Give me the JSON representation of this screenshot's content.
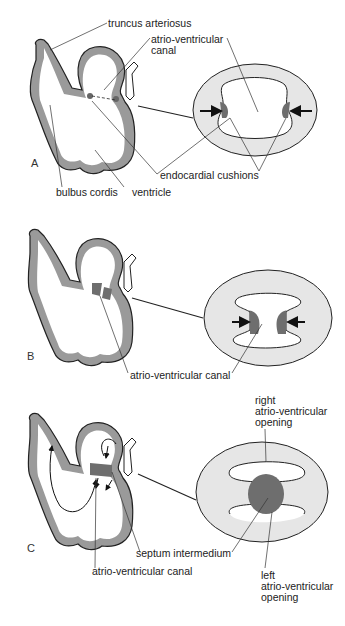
{
  "panels": [
    {
      "id": "A",
      "letter": "A",
      "labels": {
        "truncus": "truncus arteriosus",
        "av_canal_1": "atrio-ventricular",
        "av_canal_2": "canal",
        "endocardial": "endocardial cushions",
        "bulbus": "bulbus cordis",
        "ventricle": "ventricle"
      }
    },
    {
      "id": "B",
      "letter": "B",
      "labels": {
        "av_canal": "atrio-ventricular canal"
      }
    },
    {
      "id": "C",
      "letter": "C",
      "labels": {
        "right_1": "right",
        "right_2": "atrio-ventricular",
        "right_3": "opening",
        "septum": "septum intermedium",
        "av_canal": "atrio-ventricular canal",
        "left_1": "left",
        "left_2": "atrio-ventricular",
        "left_3": "opening"
      }
    }
  ],
  "colors": {
    "wall": "#9a9a9a",
    "cushion": "#6e6e6e",
    "ring": "#e6e6e6",
    "outline": "#222222"
  }
}
